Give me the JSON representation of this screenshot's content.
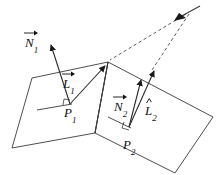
{
  "figure": {
    "background_color": "#ffffff",
    "stroke_color": "#3a3a3a",
    "label_color": "#111111",
    "width": 220,
    "height": 175
  },
  "labels": {
    "normal_1": {
      "base": "N",
      "sub": "1",
      "accent": "vector",
      "x": 25,
      "y": 35
    },
    "light_vec_1": {
      "base": "L",
      "sub": "1",
      "accent": "vector",
      "x": 63,
      "y": 76
    },
    "point_1": {
      "base": "P",
      "sub": "1",
      "accent": "none",
      "x": 64,
      "y": 106
    },
    "normal_2": {
      "base": "N",
      "sub": "2",
      "accent": "vector",
      "x": 116,
      "y": 99
    },
    "light_vec_2": {
      "base": "L",
      "sub": "2",
      "accent": "hat",
      "x": 145,
      "y": 103
    },
    "point_2": {
      "base": "P",
      "sub": "2",
      "accent": "none",
      "x": 125,
      "y": 137
    }
  },
  "geometry": {
    "surface_1": {
      "name": "left-surface-patch",
      "points": "32,78 108,62 95,133 12,148"
    },
    "surface_2": {
      "name": "right-surface-patch",
      "points": "108,62 213,117 175,173 95,133"
    },
    "ridge_edge": {
      "x1": 108,
      "y1": 62,
      "x2": 95,
      "y2": 133
    },
    "light_source": {
      "x": 190,
      "y": 10
    },
    "tangent_1": {
      "x1": 37,
      "y1": 110,
      "x2": 72,
      "y2": 104
    },
    "tangent_2": {
      "x1": 108,
      "y1": 117,
      "x2": 131,
      "y2": 128
    },
    "right_angle_1": {
      "x": 65,
      "y": 100
    },
    "right_angle_2": {
      "x": 126,
      "y": 126
    }
  },
  "vectors": {
    "N1": {
      "name": "normal-vector-1",
      "x1": 70,
      "y1": 104,
      "x2": 50,
      "y2": 42
    },
    "L1": {
      "name": "light-vector-1",
      "x1": 70,
      "y1": 104,
      "x2": 106,
      "y2": 65
    },
    "N2": {
      "name": "normal-vector-2",
      "x1": 129,
      "y1": 127,
      "x2": 142,
      "y2": 76
    },
    "L2": {
      "name": "light-vector-2",
      "x1": 129,
      "y1": 127,
      "x2": 155,
      "y2": 67
    }
  },
  "rays": {
    "ray_to_ridge": {
      "name": "dashed-ray-to-ridge",
      "x1": 186,
      "y1": 14,
      "x2": 110,
      "y2": 60
    },
    "ray_to_point": {
      "name": "dashed-ray-to-point-2",
      "x1": 189,
      "y1": 14,
      "x2": 152,
      "y2": 70
    }
  },
  "light_marker": {
    "name": "light-source-marker",
    "segment": {
      "x1": 178,
      "y1": 18,
      "x2": 200,
      "y2": 6
    }
  }
}
